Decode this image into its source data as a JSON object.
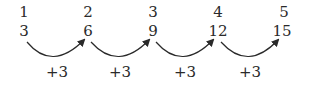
{
  "diagram": {
    "title": "",
    "positions": [
      "1",
      "2",
      "3",
      "4",
      "5"
    ],
    "terms": [
      "3",
      "6",
      "9",
      "12",
      "15"
    ],
    "steps": [
      "+3",
      "+3",
      "+3",
      "+3"
    ],
    "stroke_color": "#2a2a2a"
  }
}
